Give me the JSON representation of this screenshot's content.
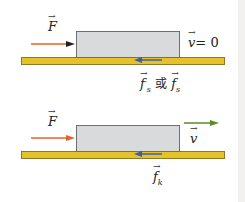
{
  "panels": [
    {
      "state": "static",
      "force_label": "F",
      "velocity_label": "v",
      "velocity_value": "= 0",
      "friction_label_1": "f",
      "friction_sub_1": "s",
      "friction_prime": "′",
      "connector": "或",
      "friction_label_2": "f",
      "friction_sub_2": "s"
    },
    {
      "state": "kinetic",
      "force_label": "F",
      "velocity_label": "v",
      "friction_label": "f",
      "friction_sub": "k"
    }
  ],
  "colors": {
    "force_arrow": "#e2642a",
    "velocity_arrow": "#5a8a2a",
    "friction_arrow": "#3a5fb0",
    "ground": "#e6c22a",
    "block": "#d9dadc"
  }
}
